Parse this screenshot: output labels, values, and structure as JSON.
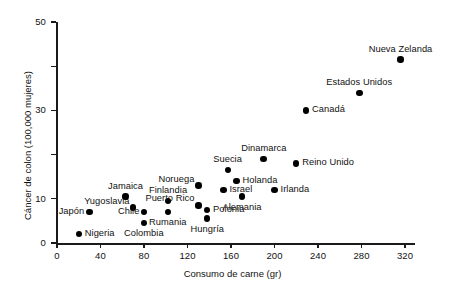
{
  "chart_data": {
    "type": "scatter",
    "title": "",
    "xlabel": "Consumo de carne (gr)",
    "ylabel": "Cáncer de colon (100,000 mujeres)",
    "xlim": [
      0,
      320
    ],
    "ylim": [
      0,
      50
    ],
    "xticks": [
      0,
      40,
      80,
      120,
      160,
      200,
      240,
      280,
      320
    ],
    "yticks": [
      0,
      10,
      30,
      50
    ],
    "yticks_minor": [
      20,
      40
    ],
    "grid": false,
    "legend": "none",
    "marker": "filled-circle",
    "marker_color": "#000000",
    "points": [
      {
        "label": "Nigeria",
        "x": 20,
        "y": 2.0,
        "label_pos": "right"
      },
      {
        "label": "Japón",
        "x": 30,
        "y": 7.0,
        "label_pos": "left"
      },
      {
        "label": "Yugoslavia",
        "x": 70,
        "y": 8.0,
        "label_pos": "left-above"
      },
      {
        "label": "Jamaica",
        "x": 63,
        "y": 10.5,
        "label_pos": "above"
      },
      {
        "label": "Chile",
        "x": 80,
        "y": 7.0,
        "label_pos": "left"
      },
      {
        "label": "Colombia",
        "x": 80,
        "y": 4.5,
        "label_pos": "below"
      },
      {
        "label": "Rumania",
        "x": 102,
        "y": 7.0,
        "label_pos": "below"
      },
      {
        "label": "Finlandia",
        "x": 102,
        "y": 9.5,
        "label_pos": "above"
      },
      {
        "label": "Puerto Rico",
        "x": 130,
        "y": 8.5,
        "label_pos": "left-above"
      },
      {
        "label": "Polonia",
        "x": 138,
        "y": 7.5,
        "label_pos": "right"
      },
      {
        "label": "Hungría",
        "x": 138,
        "y": 5.5,
        "label_pos": "below"
      },
      {
        "label": "Israel",
        "x": 153,
        "y": 12.0,
        "label_pos": "right"
      },
      {
        "label": "Noruega",
        "x": 130,
        "y": 13.0,
        "label_pos": "left-above"
      },
      {
        "label": "Holanda",
        "x": 165,
        "y": 14.0,
        "label_pos": "right"
      },
      {
        "label": "Suecia",
        "x": 157,
        "y": 16.5,
        "label_pos": "above"
      },
      {
        "label": "Alemania",
        "x": 170,
        "y": 10.5,
        "label_pos": "below"
      },
      {
        "label": "Irlanda",
        "x": 200,
        "y": 12.0,
        "label_pos": "right"
      },
      {
        "label": "Dinamarca",
        "x": 190,
        "y": 19.0,
        "label_pos": "above"
      },
      {
        "label": "Reino Unido",
        "x": 220,
        "y": 18.0,
        "label_pos": "right"
      },
      {
        "label": "Canadá",
        "x": 229,
        "y": 30.0,
        "label_pos": "right"
      },
      {
        "label": "Estados Unidos",
        "x": 278,
        "y": 34.0,
        "label_pos": "above"
      },
      {
        "label": "Nueva Zelanda",
        "x": 316,
        "y": 41.5,
        "label_pos": "above"
      }
    ]
  }
}
